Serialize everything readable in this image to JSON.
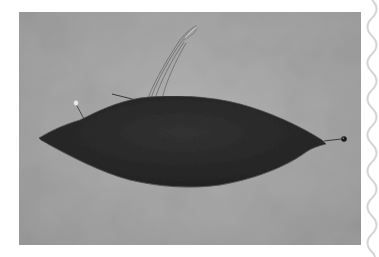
{
  "image": {
    "subject": "dark felt lens-shaped pincushion with pins and threaded needle on gray background",
    "style": "grayscale photograph",
    "frame": "white margin with wavy decorative line on right edge"
  },
  "colors": {
    "page_background": "#ffffff",
    "photo_background": "#a8a8a8",
    "felt": "#2b2b2b",
    "felt_edge": "#4a4a4a",
    "thread": "#6f6f6f",
    "pin_head_light": "#e8e8e8",
    "pin_head_dark": "#1a1a1a",
    "wavy_border": "#d4d4d4"
  },
  "elements": {
    "felt_pincushion": "felt-pincushion",
    "thread_loop": "thread-loop",
    "left_pin": "pearl-pin",
    "needle": "needle",
    "right_pin": "black-head-pin",
    "wavy_border": "wavy-edge-border"
  }
}
